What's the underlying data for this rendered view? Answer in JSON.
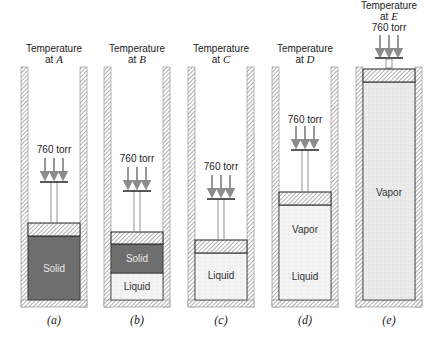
{
  "figure": {
    "panels": [
      {
        "id": "a",
        "caption": "(a)",
        "temperature_label": "Temperature",
        "temperature_at": "at ",
        "temperature_var": "A",
        "pressure_label": "760 torr",
        "phases": [
          {
            "name": "Solid",
            "label": "Solid"
          }
        ]
      },
      {
        "id": "b",
        "caption": "(b)",
        "temperature_label": "Temperature",
        "temperature_at": "at ",
        "temperature_var": "B",
        "pressure_label": "760 torr",
        "phases": [
          {
            "name": "Solid",
            "label": "Solid"
          },
          {
            "name": "Liquid",
            "label": "Liquid"
          }
        ]
      },
      {
        "id": "c",
        "caption": "(c)",
        "temperature_label": "Temperature",
        "temperature_at": "at ",
        "temperature_var": "C",
        "pressure_label": "760 torr",
        "phases": [
          {
            "name": "Liquid",
            "label": "Liquid"
          }
        ]
      },
      {
        "id": "d",
        "caption": "(d)",
        "temperature_label": "Temperature",
        "temperature_at": "at ",
        "temperature_var": "D",
        "pressure_label": "760 torr",
        "phases": [
          {
            "name": "Vapor",
            "label": "Vapor"
          },
          {
            "name": "Liquid",
            "label": "Liquid"
          }
        ]
      },
      {
        "id": "e",
        "caption": "(e)",
        "temperature_label": "Temperature",
        "temperature_at": "at ",
        "temperature_var": "E",
        "pressure_label": "760 torr",
        "phases": [
          {
            "name": "Vapor",
            "label": "Vapor"
          }
        ]
      }
    ],
    "colors": {
      "solid": "#6e6e6e",
      "liquid": "#f1f1f1",
      "vapor": "#e6e6e6",
      "wall_hatch": "#8a8a8a",
      "arrow": "#8c8c8c",
      "outline": "#333333"
    }
  }
}
